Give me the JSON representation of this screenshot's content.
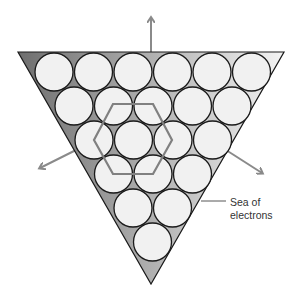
{
  "figure": {
    "type": "metallic-bonding-close-packed-layer",
    "label": {
      "line1": "Sea of",
      "line2": "electrons"
    },
    "colors": {
      "circle_fill": "#f1f1f1",
      "circle_stroke": "#1a1a1a",
      "triangle_gradient_dark": "#6e6e6e",
      "triangle_gradient_light": "#f4f4f4",
      "triangle_stroke": "#1a1a1a",
      "arrow": "#8a8a8a",
      "hexagon": "#808080",
      "leader_line": "#444444"
    },
    "triangle": {
      "vertices": [
        [
          18,
          52
        ],
        [
          284,
          52
        ],
        [
          151,
          284
        ]
      ]
    },
    "atoms": {
      "radius": 19,
      "rows": [
        {
          "y": 72,
          "x": [
            54,
            93.5,
            133,
            172.5,
            212,
            251.5
          ]
        },
        {
          "y": 106,
          "x": [
            74,
            113.5,
            153,
            192.5,
            232
          ]
        },
        {
          "y": 140,
          "x": [
            94,
            133.5,
            173,
            212.5
          ]
        },
        {
          "y": 174,
          "x": [
            113.5,
            153,
            192.5
          ]
        },
        {
          "y": 208,
          "x": [
            133,
            172.5
          ]
        },
        {
          "y": 242,
          "x": [
            152.5
          ]
        }
      ]
    },
    "hexagon": {
      "points": [
        [
          113,
          104
        ],
        [
          153,
          104
        ],
        [
          172,
          140
        ],
        [
          153,
          174
        ],
        [
          113,
          174
        ],
        [
          94,
          140
        ]
      ]
    },
    "arrows": [
      {
        "name": "arrow-up",
        "from": [
          151,
          80
        ],
        "to": [
          151,
          18
        ]
      },
      {
        "name": "arrow-lower-left",
        "from": [
          76,
          150
        ],
        "to": [
          40,
          168
        ]
      },
      {
        "name": "arrow-lower-right",
        "from": [
          226,
          150
        ],
        "to": [
          262,
          173
        ]
      }
    ],
    "leader": {
      "from": [
        201,
        201
      ],
      "to": [
        226,
        201
      ]
    }
  }
}
